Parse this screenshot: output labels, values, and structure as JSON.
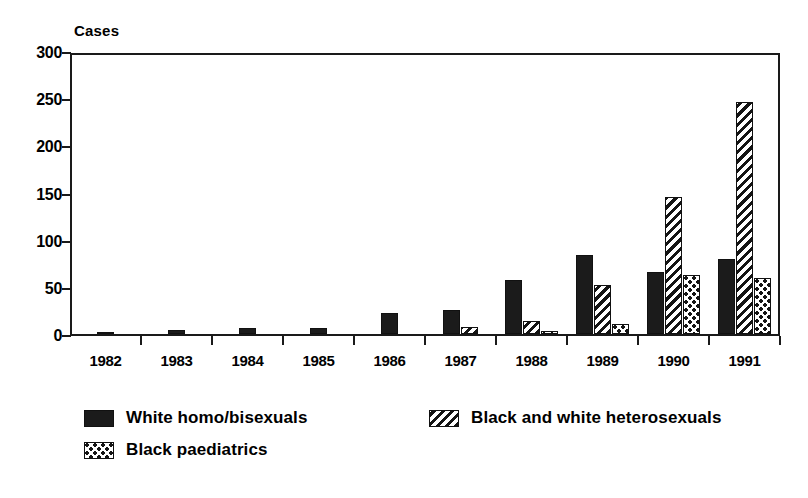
{
  "chart_data": {
    "type": "bar",
    "title": "",
    "xlabel": "",
    "ylabel": "Cases",
    "ylim": [
      0,
      300
    ],
    "yticks": [
      0,
      50,
      100,
      150,
      200,
      250,
      300
    ],
    "grid": false,
    "legend_position": "bottom-left",
    "categories": [
      "1982",
      "1983",
      "1984",
      "1985",
      "1986",
      "1987",
      "1988",
      "1989",
      "1990",
      "1991"
    ],
    "series": [
      {
        "name": "White homo/bisexuals",
        "pattern": "solid-black",
        "values": [
          2,
          4,
          6,
          6,
          22,
          25,
          57,
          84,
          66,
          80
        ]
      },
      {
        "name": "Black and white heterosexuals",
        "pattern": "diagonal-hatch",
        "values": [
          0,
          0,
          0,
          0,
          0,
          7,
          14,
          52,
          145,
          246
        ]
      },
      {
        "name": "Black paediatrics",
        "pattern": "checkered-dots",
        "values": [
          0,
          0,
          0,
          0,
          0,
          0,
          3,
          11,
          63,
          59
        ]
      }
    ]
  },
  "legend": {
    "items": [
      {
        "label": "White homo/bisexuals",
        "swatch": "solid-black-swatch"
      },
      {
        "label": "Black and white heterosexuals",
        "swatch": "diagonal-hatch-swatch"
      },
      {
        "label": "Black paediatrics",
        "swatch": "checkered-dots-swatch"
      }
    ]
  },
  "colors": {
    "ink": "#1a1a1a",
    "background": "#ffffff"
  }
}
